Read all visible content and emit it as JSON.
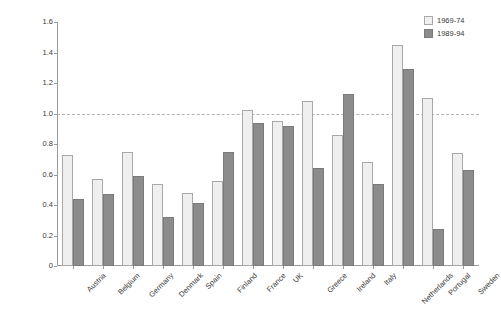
{
  "chart_data": {
    "type": "bar",
    "title": "",
    "xlabel": "",
    "ylabel": "Specialization in ICTs",
    "ylim": [
      0,
      1.6
    ],
    "yticks": [
      "0",
      "0.2",
      "0.4",
      "0.6",
      "0.8",
      "1.0",
      "1.2",
      "1.4",
      "1.6"
    ],
    "grid": false,
    "legend_position": "top-right",
    "reference_line": {
      "value": 1.0,
      "style": "dashed",
      "color": "#b3b3b3"
    },
    "categories": [
      "Austria",
      "Belgium",
      "Germany",
      "Denmark",
      "Spain",
      "Finland",
      "France",
      "UK",
      "Greece",
      "Ireland",
      "Italy",
      "Netherlands",
      "Portugal",
      "Sweden"
    ],
    "series": [
      {
        "name": "1969-74",
        "color": "#efefef",
        "values": [
          0.73,
          0.57,
          0.75,
          0.54,
          0.48,
          0.56,
          1.02,
          0.95,
          1.08,
          0.86,
          0.68,
          1.45,
          1.1,
          0.74
        ]
      },
      {
        "name": "1989-94",
        "color": "#8c8c8c",
        "values": [
          0.44,
          0.47,
          0.59,
          0.32,
          0.41,
          0.75,
          0.94,
          0.92,
          0.64,
          1.13,
          0.54,
          1.29,
          0.24,
          0.63
        ]
      }
    ]
  }
}
